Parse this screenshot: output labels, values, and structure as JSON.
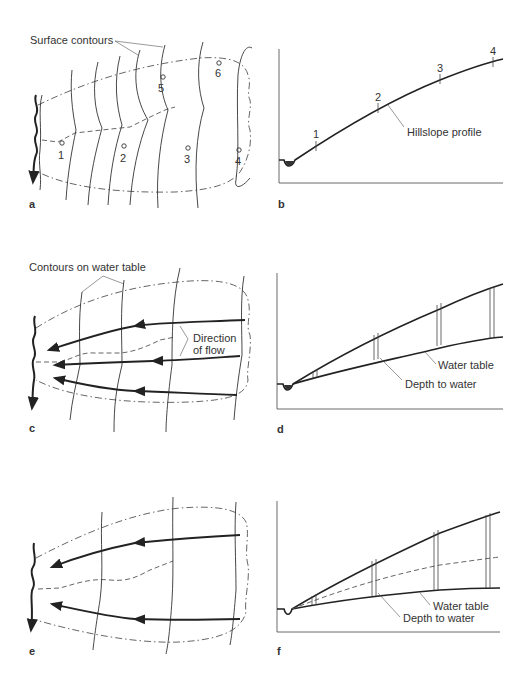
{
  "figure": {
    "panels": {
      "a": {
        "letter": "a",
        "label": "Surface contours",
        "points": [
          "1",
          "2",
          "3",
          "4",
          "5",
          "6"
        ]
      },
      "b": {
        "letter": "b",
        "label": "Hillslope profile",
        "ticks": [
          "1",
          "2",
          "3",
          "4"
        ]
      },
      "c": {
        "letter": "c",
        "label_contours": "Contours on water table",
        "label_flow_1": "Direction",
        "label_flow_2": "of flow"
      },
      "d": {
        "letter": "d",
        "label_water_table": "Water table",
        "label_depth": "Depth to water"
      },
      "e": {
        "letter": "e"
      },
      "f": {
        "letter": "f",
        "label_water_table": "Water table",
        "label_depth": "Depth to water"
      }
    }
  }
}
